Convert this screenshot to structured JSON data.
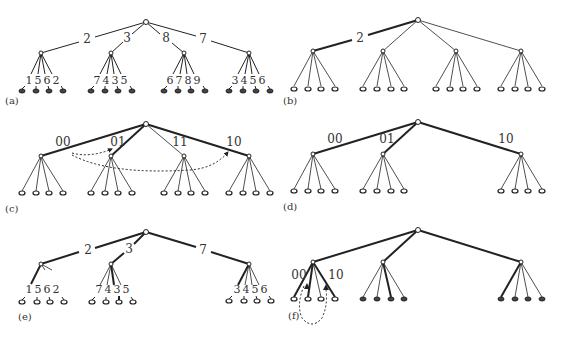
{
  "panels": [
    {
      "id": "a",
      "label": "(a)",
      "edge_labels": [
        "2",
        "3",
        "8",
        "7"
      ],
      "leaf_labels": [
        [
          "1",
          "5",
          "6",
          "2"
        ],
        [
          "7",
          "4",
          "3",
          "5"
        ],
        [
          "6",
          "7",
          "8",
          "9"
        ],
        [
          "3",
          "4",
          "5",
          "6"
        ]
      ],
      "leaf_style": "filled"
    },
    {
      "id": "b",
      "label": "(b)",
      "edge_labels": [
        "2"
      ],
      "leaf_style": "open"
    },
    {
      "id": "c",
      "label": "(c)",
      "edge_labels": [
        "00",
        "01",
        "11",
        "10"
      ],
      "leaf_style": "open"
    },
    {
      "id": "d",
      "label": "(d)",
      "edge_labels": [
        "00",
        "01",
        "10"
      ],
      "leaf_style": "open"
    },
    {
      "id": "e",
      "label": "(e)",
      "edge_labels": [
        "2",
        "3",
        "7"
      ],
      "leaf_labels": [
        [
          "1",
          "5",
          "6",
          "2"
        ],
        [
          "7",
          "4",
          "3",
          "5"
        ],
        [
          "3",
          "4",
          "5",
          "6"
        ]
      ],
      "leaf_style": "open"
    },
    {
      "id": "f",
      "label": "(f)",
      "edge_labels": [
        "00",
        "10"
      ],
      "leaf_style": "mixed"
    }
  ],
  "colors": {
    "line": "#222222",
    "leaf_fill": "#444444",
    "text": "#333333"
  }
}
